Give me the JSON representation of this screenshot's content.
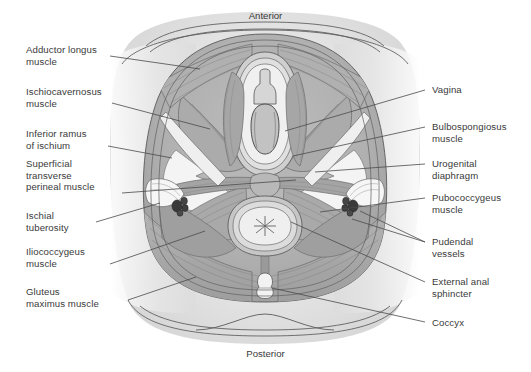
{
  "figure": {
    "orientation": {
      "top": "Anterior",
      "bottom": "Posterior"
    },
    "colors": {
      "page_background": "#ffffff",
      "body_fill": "#e3e3e3",
      "skin_shadow": "#d3d3d3",
      "muscle_mid": "#a8a8a8",
      "muscle_dark": "#8f8f8f",
      "muscle_light": "#c4c4c4",
      "pale_fat": "#f2f2f2",
      "vessel_dark": "#3b3b3b",
      "outline": "#4a4a4a",
      "leader_line": "#4a4a4a",
      "text": "#3a3a3a"
    },
    "labels_left": [
      {
        "id": "adductor-longus-muscle",
        "text": "Adductor longus\nmuscle",
        "x": 26,
        "y": 44,
        "leader": [
          [
            110,
            56
          ],
          [
            200,
            69
          ]
        ]
      },
      {
        "id": "ischiocavernosus-muscle",
        "text": "Ischiocavernosus\nmuscle",
        "x": 26,
        "y": 86,
        "leader": [
          [
            112,
            103
          ],
          [
            210,
            129
          ]
        ]
      },
      {
        "id": "inferior-ramus-of-ischium",
        "text": "Inferior ramus\nof ischium",
        "x": 26,
        "y": 128,
        "leader": [
          [
            108,
            146
          ],
          [
            172,
            158
          ]
        ]
      },
      {
        "id": "superficial-transverse-perineal-muscle",
        "text": "Superficial\ntransverse\nperineal muscle",
        "x": 26,
        "y": 158,
        "leader": [
          [
            122,
            193
          ],
          [
            296,
            180
          ]
        ]
      },
      {
        "id": "ischial-tuberosity",
        "text": "Ischial\ntuberosity",
        "x": 26,
        "y": 210,
        "leader": [
          [
            96,
            222
          ],
          [
            160,
            203
          ]
        ]
      },
      {
        "id": "iliococcygeus-muscle",
        "text": "Iliococcygeus\nmuscle",
        "x": 26,
        "y": 246,
        "leader": [
          [
            110,
            264
          ],
          [
            205,
            231
          ]
        ]
      },
      {
        "id": "gluteus-maximus-muscle",
        "text": "Gluteus\nmaximus muscle",
        "x": 26,
        "y": 286,
        "leader": [
          [
            128,
            300
          ],
          [
            196,
            277
          ]
        ]
      }
    ],
    "labels_right": [
      {
        "id": "vagina",
        "text": "Vagina",
        "x": 432,
        "y": 84,
        "leader": [
          [
            425,
            90
          ],
          [
            285,
            131
          ]
        ]
      },
      {
        "id": "bulbospongiosus-muscle",
        "text": "Bulbospongiosus\nmuscle",
        "x": 432,
        "y": 121,
        "leader": [
          [
            425,
            127
          ],
          [
            293,
            156
          ]
        ]
      },
      {
        "id": "urogenital-diaphragm",
        "text": "Urogenital\ndiaphragm",
        "x": 432,
        "y": 158,
        "leader": [
          [
            425,
            164
          ],
          [
            315,
            172
          ]
        ]
      },
      {
        "id": "pubococcygeus-muscle",
        "text": "Pubococcygeus\nmuscle",
        "x": 432,
        "y": 192,
        "leader": [
          [
            425,
            198
          ],
          [
            320,
            212
          ]
        ]
      },
      {
        "id": "pudendal-vessels",
        "text": "Pudendal\nvessels",
        "x": 432,
        "y": 236,
        "leader": [
          [
            425,
            242
          ],
          [
            352,
            219
          ]
        ]
      },
      {
        "id": "external-anal-sphincter",
        "text": "External anal\nsphincter",
        "x": 432,
        "y": 276,
        "leader": [
          [
            425,
            282
          ],
          [
            291,
            222
          ]
        ]
      },
      {
        "id": "coccyx",
        "text": "Coccyx",
        "x": 432,
        "y": 317,
        "leader": [
          [
            425,
            322
          ],
          [
            272,
            288
          ]
        ]
      }
    ],
    "structures": [
      "body outline",
      "thigh shadow",
      "vaginal orifice",
      "clitoris / vestibule",
      "anal orifice",
      "coccyx",
      "pudendal vessel bundle left",
      "pudendal vessel bundle right"
    ],
    "caption": ""
  }
}
